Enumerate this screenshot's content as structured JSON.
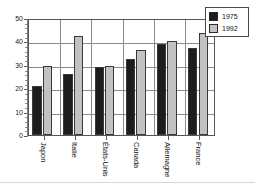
{
  "chart_data": {
    "type": "bar",
    "title": "",
    "subtitle": "",
    "xlabel": "",
    "ylabel": "",
    "categories": [
      "Japon",
      "Italie",
      "États-Unis",
      "Canada",
      "Allemagne",
      "France"
    ],
    "series": [
      {
        "name": "1975",
        "color": "#1d1d1d",
        "values": [
          21,
          26,
          29,
          32.5,
          39,
          37
        ]
      },
      {
        "name": "1992",
        "color": "#c2c2c2",
        "values": [
          29.5,
          42.5,
          29.5,
          36.5,
          40,
          43.5
        ]
      }
    ],
    "ylim": [
      0,
      50
    ],
    "yticks": [
      0,
      10,
      20,
      30,
      40,
      50
    ],
    "ytick_labels": [
      "0",
      "10",
      "20",
      "30",
      "40",
      "50"
    ],
    "grid": true,
    "grid_axis": "both",
    "legend_position": "top-right",
    "legend_entries": [
      "1975",
      "1992"
    ]
  },
  "legend": {
    "entries": [
      {
        "label": "1975",
        "swatch": "legend-swatch-1975"
      },
      {
        "label": "1992",
        "swatch": "legend-swatch-1992"
      }
    ]
  },
  "axes": {
    "y_tick_labels": [
      "50",
      "40",
      "30",
      "20",
      "10",
      "0"
    ],
    "x_tick_labels": [
      "Japon",
      "Italie",
      "États-Unis",
      "Canada",
      "Allemagne",
      "France"
    ]
  },
  "colors": {
    "series_1975": "#1d1d1d",
    "series_1992": "#c2c2c2",
    "grid": "#8a8a8a",
    "axis": "#555555",
    "background": "#ffffff"
  }
}
